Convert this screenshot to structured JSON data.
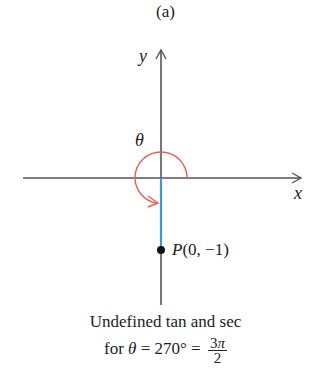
{
  "figure": {
    "panel_label": "(a)",
    "axes": {
      "x_label": "x",
      "y_label": "y"
    },
    "angle_label": "θ",
    "point": {
      "name": "P",
      "coords": "(0, −1)"
    },
    "caption": {
      "line1": "Undefined tan and sec",
      "line2_prefix": "for ",
      "line2_theta": "θ",
      "line2_mid": " = 270° = ",
      "fraction_num_coef": "3",
      "fraction_num_pi": "π",
      "fraction_den": "2"
    },
    "colors": {
      "axis": "#555555",
      "arc": "#e8604c",
      "terminal_side": "#3a9ad9",
      "point": "#111111",
      "text": "#222222"
    }
  }
}
